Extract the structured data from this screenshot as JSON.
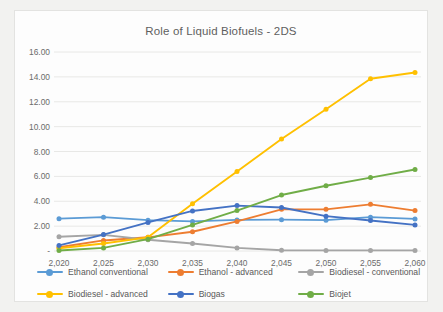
{
  "chart_data": {
    "type": "line",
    "title": "Role of Liquid Biofuels - 2DS",
    "xlabel": "",
    "ylabel": "",
    "grid": true,
    "legend_position": "bottom",
    "xlim": [
      2020,
      2060
    ],
    "ylim": [
      0,
      16
    ],
    "ytick_labels": [
      "16.00",
      "14.00",
      "12.00",
      "10.00",
      "8.00",
      "6.00",
      "4.00",
      "2.00",
      "-"
    ],
    "ytick_values": [
      16,
      14,
      12,
      10,
      8,
      6,
      4,
      2,
      0
    ],
    "categories": [
      "2,020",
      "2,025",
      "2,030",
      "2,035",
      "2,040",
      "2,045",
      "2,050",
      "2,055",
      "2,060"
    ],
    "x": [
      2020,
      2025,
      2030,
      2035,
      2040,
      2045,
      2050,
      2055,
      2060
    ],
    "series": [
      {
        "name": "Ethanol conventional",
        "color": "#5B9BD5",
        "values": [
          2.6,
          2.72,
          2.48,
          2.38,
          2.5,
          2.52,
          2.48,
          2.72,
          2.58
        ]
      },
      {
        "name": "Ethanol - advanced",
        "color": "#ED7D31",
        "values": [
          0.3,
          0.85,
          1.1,
          1.55,
          2.38,
          3.35,
          3.35,
          3.75,
          3.25
        ]
      },
      {
        "name": "Biodiesel - conventional",
        "color": "#A5A5A5",
        "values": [
          1.15,
          1.3,
          0.9,
          0.6,
          0.25,
          0.06,
          0.05,
          0.05,
          0.05
        ]
      },
      {
        "name": "Biodiesel - advanced",
        "color": "#FFC000",
        "values": [
          0.22,
          0.6,
          1.1,
          3.8,
          6.4,
          9.0,
          11.4,
          13.85,
          14.35
        ]
      },
      {
        "name": "Biogas",
        "color": "#4472C4",
        "values": [
          0.45,
          1.32,
          2.3,
          3.22,
          3.65,
          3.5,
          2.8,
          2.45,
          2.1
        ]
      },
      {
        "name": "Biojet",
        "color": "#70AD47",
        "values": [
          0.04,
          0.25,
          0.95,
          2.1,
          3.25,
          4.5,
          5.25,
          5.9,
          6.55
        ]
      }
    ]
  },
  "legend": {
    "items": [
      {
        "label": "Ethanol conventional"
      },
      {
        "label": "Ethanol - advanced"
      },
      {
        "label": "Biodiesel - conventional"
      },
      {
        "label": "Biodiesel - advanced"
      },
      {
        "label": "Biogas"
      },
      {
        "label": "Biojet"
      }
    ]
  }
}
